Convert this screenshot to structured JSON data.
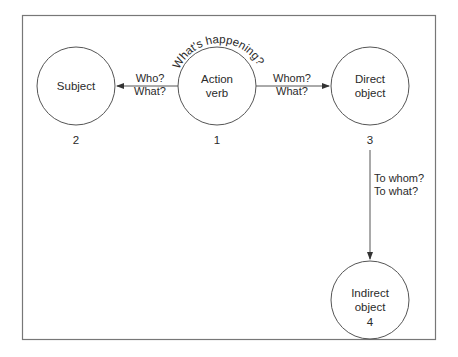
{
  "diagram": {
    "nodes": [
      {
        "id": "action-verb",
        "label_line1": "Action",
        "label_line2": "verb",
        "number": "1"
      },
      {
        "id": "subject",
        "label_line1": "Subject",
        "label_line2": "",
        "number": "2"
      },
      {
        "id": "direct-object",
        "label_line1": "Direct",
        "label_line2": "object",
        "number": "3"
      },
      {
        "id": "indirect-object",
        "label_line1": "Indirect",
        "label_line2": "object",
        "number": "4"
      }
    ],
    "edges": [
      {
        "from": "action-verb",
        "to": "subject",
        "label_line1": "Who?",
        "label_line2": "What?"
      },
      {
        "from": "action-verb",
        "to": "direct-object",
        "label_line1": "Whom?",
        "label_line2": "What?"
      },
      {
        "from": "direct-object",
        "to": "indirect-object",
        "label_line1": "To whom?",
        "label_line2": "To what?"
      }
    ],
    "arc_label": "What's happening?",
    "colors": {
      "stroke": "#555555",
      "text": "#2a2a2a",
      "background": "#ffffff"
    }
  }
}
